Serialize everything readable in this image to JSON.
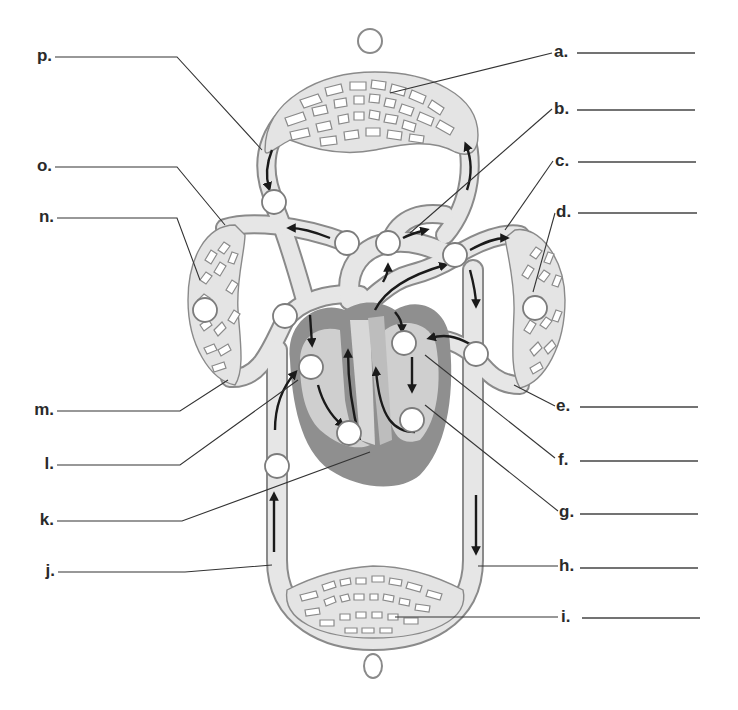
{
  "diagram": {
    "colors": {
      "vessel_fill": "#e4e4e4",
      "vessel_outline": "#8a8a8a",
      "heart_muscle": "#8f8f8f",
      "heart_chamber": "#cfcfcf",
      "arrow": "#1a1a1a",
      "label_text": "#2a2a2a"
    },
    "labels_right": [
      {
        "letter": "a.",
        "answer": "",
        "target": "pulmonary capillaries (top capillary bed)"
      },
      {
        "letter": "b.",
        "answer": "",
        "target": "pulmonary trunk/artery near top"
      },
      {
        "letter": "c.",
        "answer": "",
        "target": "vessel to right-side capillary bed"
      },
      {
        "letter": "d.",
        "answer": "",
        "target": "right-side capillary bed"
      },
      {
        "letter": "e.",
        "answer": "",
        "target": "vessel returning from right-side capillary bed"
      },
      {
        "letter": "f.",
        "answer": "",
        "target": "upper right heart chamber"
      },
      {
        "letter": "g.",
        "answer": "",
        "target": "lower right heart chamber"
      },
      {
        "letter": "h.",
        "answer": "",
        "target": "descending vessel to lower capillaries"
      },
      {
        "letter": "i.",
        "answer": "",
        "target": "lower (systemic) capillary bed"
      }
    ],
    "labels_left": [
      {
        "letter": "p.",
        "answer": "",
        "target": "vessel descending from top capillary bed"
      },
      {
        "letter": "o.",
        "answer": "",
        "target": "vessel to left-side capillary bed"
      },
      {
        "letter": "n.",
        "answer": "",
        "target": "left-side capillary bed"
      },
      {
        "letter": "m.",
        "answer": "",
        "target": "vessel returning from left-side capillary bed"
      },
      {
        "letter": "l.",
        "answer": "",
        "target": "upper left heart chamber"
      },
      {
        "letter": "k.",
        "answer": "",
        "target": "heart septum / wall"
      },
      {
        "letter": "j.",
        "answer": "",
        "target": "ascending vessel from lower capillaries"
      }
    ],
    "blank_circles": {
      "count": 15,
      "note": "Unfilled circles on the diagram for marking / coloring"
    },
    "legend_circles": {
      "top": "",
      "bottom": ""
    }
  }
}
